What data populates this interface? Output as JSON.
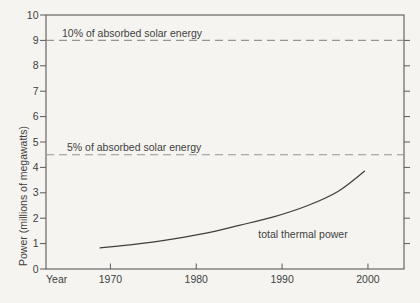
{
  "figure": {
    "paper_color": "#f5f4f0",
    "ink_color": "#3f3f3f",
    "frame_color": "#5a5a5a",
    "dash_color": "#949494"
  },
  "chart_data": {
    "type": "line",
    "title": "",
    "xlabel": "Year",
    "ylabel": "Power (millions of megawatts)",
    "xlim": [
      1962.5,
      2004.2
    ],
    "ylim": [
      0,
      10
    ],
    "x_ticks": [
      1970,
      1980,
      1990,
      2000
    ],
    "y_ticks": [
      0,
      1,
      2,
      3,
      4,
      5,
      6,
      7,
      8,
      9,
      10
    ],
    "right_ticks": [
      1,
      2,
      3,
      4,
      5,
      6,
      7,
      8,
      9
    ],
    "grid": false,
    "legend_position": "none",
    "series": [
      {
        "name": "total thermal power",
        "x": [
          1968.8,
          1973,
          1977,
          1981,
          1985,
          1989,
          1993,
          1996.5,
          1999.6
        ],
        "y": [
          0.83,
          0.98,
          1.17,
          1.4,
          1.72,
          2.05,
          2.5,
          3.05,
          3.85
        ],
        "style": "solid",
        "label_at": {
          "x": 1992.4,
          "y": 1.25
        }
      }
    ],
    "reference_lines": [
      {
        "value": 9,
        "label": "10% of absorbed solar energy",
        "label_x": 1964.3,
        "style": "dashed"
      },
      {
        "value": 4.5,
        "label": "5% of absorbed solar energy",
        "label_x": 1965.0,
        "style": "dashed"
      }
    ]
  }
}
